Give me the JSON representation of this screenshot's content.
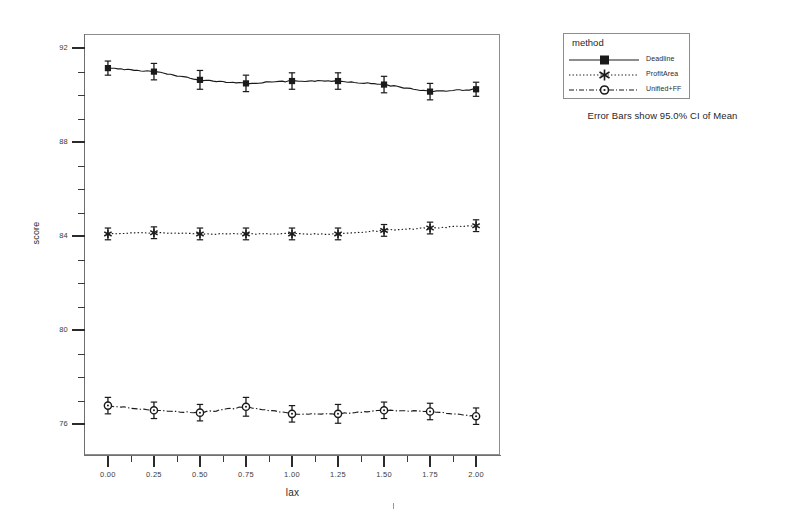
{
  "chart_data": {
    "type": "line",
    "title": "",
    "xlabel": "lax",
    "ylabel": "score",
    "xlim": [
      -0.13,
      2.13
    ],
    "ylim": [
      74.7,
      92.6
    ],
    "xticks": [
      "0.00",
      "0.25",
      "0.50",
      "0.75",
      "1.00",
      "1.25",
      "1.50",
      "1.75",
      "2.00"
    ],
    "xtick_values": [
      0.0,
      0.25,
      0.5,
      0.75,
      1.0,
      1.25,
      1.5,
      1.75,
      2.0
    ],
    "yticks": [
      "92",
      "88",
      "84",
      "80",
      "76"
    ],
    "ytick_values": [
      92,
      88,
      84,
      80,
      76
    ],
    "grid": false,
    "legend_position": "right-top",
    "legend_title": "method",
    "error_bars": "95.0% CI of Mean",
    "x": [
      0.0,
      0.25,
      0.5,
      0.75,
      1.0,
      1.25,
      1.5,
      1.75,
      2.0
    ],
    "series": [
      {
        "name": "Deadline",
        "marker": "filled-square",
        "linestyle": "solid",
        "color": "#1a1a1a",
        "values": [
          91.15,
          91.0,
          90.65,
          90.5,
          90.6,
          90.6,
          90.45,
          90.15,
          90.25
        ],
        "ci_low": [
          90.85,
          90.65,
          90.25,
          90.15,
          90.25,
          90.25,
          90.1,
          89.8,
          89.95
        ],
        "ci_high": [
          91.45,
          91.35,
          91.05,
          90.85,
          90.95,
          90.95,
          90.8,
          90.5,
          90.55
        ]
      },
      {
        "name": "ProfitArea",
        "marker": "asterisk",
        "linestyle": "dotted",
        "color": "#1a1a1a",
        "values": [
          84.1,
          84.15,
          84.1,
          84.1,
          84.1,
          84.1,
          84.25,
          84.35,
          84.45
        ],
        "ci_low": [
          83.85,
          83.9,
          83.85,
          83.85,
          83.85,
          83.85,
          84.0,
          84.1,
          84.2
        ],
        "ci_high": [
          84.35,
          84.4,
          84.35,
          84.35,
          84.35,
          84.35,
          84.5,
          84.6,
          84.7
        ]
      },
      {
        "name": "Unified+FF",
        "marker": "open-circle",
        "linestyle": "dash-dot",
        "color": "#1a1a1a",
        "values": [
          76.8,
          76.6,
          76.5,
          76.75,
          76.45,
          76.45,
          76.6,
          76.55,
          76.35
        ],
        "ci_low": [
          76.45,
          76.25,
          76.15,
          76.35,
          76.1,
          76.05,
          76.25,
          76.2,
          76.0
        ],
        "ci_high": [
          77.15,
          76.95,
          76.85,
          77.15,
          76.8,
          76.85,
          76.95,
          76.9,
          76.7
        ]
      }
    ]
  },
  "axes": {
    "y_title": "score",
    "x_title": "lax"
  },
  "legend": {
    "title": "method",
    "entries": [
      {
        "label": "Deadline"
      },
      {
        "label": "ProfitArea"
      },
      {
        "label": "Unified+FF"
      }
    ]
  },
  "caption": {
    "error_bars_note": "Error Bars show 95.0% CI of Mean"
  },
  "colors": {
    "ink": "#1a1a1a",
    "frame": "#8d8d8d",
    "background": "#ffffff"
  }
}
